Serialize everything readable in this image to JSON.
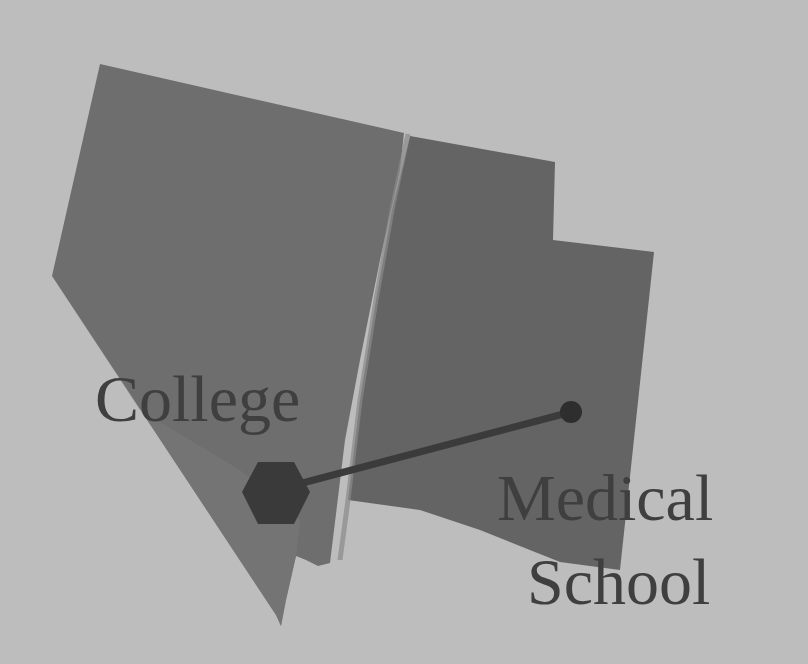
{
  "diagram": {
    "background_color": "#bdbdbd",
    "regions": [
      {
        "id": "left-region",
        "description": "Nevada-shaped region",
        "fill": "#6c6c6c"
      },
      {
        "id": "left-region-lower",
        "description": "lower tip of Nevada-shaped region",
        "fill": "#7a7a7a"
      },
      {
        "id": "right-region",
        "description": "Utah-shaped region",
        "fill": "#636363"
      }
    ],
    "markers": [
      {
        "id": "college-marker",
        "shape": "hexagon",
        "fill": "#3a3a3a",
        "x": 276,
        "y": 490
      },
      {
        "id": "medical-school-marker",
        "shape": "circle",
        "fill": "#2f2f2f",
        "x": 571,
        "y": 412
      }
    ],
    "connector": {
      "from": "college-marker",
      "to": "medical-school-marker",
      "color": "#3b3b3b"
    },
    "labels": {
      "college": "College",
      "medical_line1": "Medical",
      "medical_line2": "School"
    }
  }
}
